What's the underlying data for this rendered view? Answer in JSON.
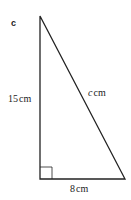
{
  "diagram": {
    "part_label": "c",
    "shape": "right-triangle",
    "vertices": {
      "top": [
        40,
        16
      ],
      "bottom_left": [
        40,
        179
      ],
      "bottom_right": [
        125,
        179
      ]
    },
    "right_angle_marker": "bottom-left",
    "sides": {
      "vertical": {
        "value": "15",
        "unit": "cm",
        "label": "15 cm"
      },
      "base": {
        "value": "8",
        "unit": "cm",
        "label": "8 cm"
      },
      "hypotenuse": {
        "variable": "c",
        "unit": "cm",
        "label": "c cm"
      }
    },
    "colors": {
      "stroke": "#222222",
      "background": "#ffffff"
    }
  }
}
